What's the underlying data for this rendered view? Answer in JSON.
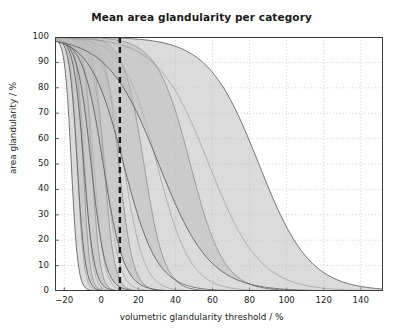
{
  "chart_data": {
    "type": "area",
    "title": "Mean area glandularity per category",
    "xlabel": "volumetric glandularity threshold / %",
    "ylabel": "area glandularity / %",
    "xlim": [
      -25,
      152
    ],
    "ylim": [
      0,
      100
    ],
    "xticks": [
      -20,
      0,
      20,
      40,
      60,
      80,
      100,
      120,
      140
    ],
    "xticklabels": [
      "−20",
      "0",
      "20",
      "40",
      "60",
      "80",
      "100",
      "120",
      "140"
    ],
    "yticks": [
      0,
      10,
      20,
      30,
      40,
      50,
      60,
      70,
      80,
      90,
      100
    ],
    "yticklabels": [
      "0",
      "10",
      "20",
      "30",
      "40",
      "50",
      "60",
      "70",
      "80",
      "90",
      "100"
    ],
    "grid": true,
    "grid_style": "dotted",
    "legend": "none",
    "fill_color": "#bdbdbd",
    "fill_opacity": 0.55,
    "line_color": "#555555",
    "annotations": [
      {
        "name": "threshold-line",
        "type": "vertical-dashed-line",
        "x": 10,
        "color": "#1a1a1a",
        "label": ""
      }
    ],
    "series": [
      {
        "name": "category-1",
        "midpoint": -13.0,
        "width": 7.0,
        "band_offset": 3.2,
        "x": [
          -25,
          -22,
          -19,
          -16,
          -13,
          -10,
          -7,
          -4,
          -1,
          2,
          6,
          10,
          20,
          40,
          80,
          120,
          152
        ],
        "upper": [
          100,
          100,
          99,
          96,
          86,
          65,
          38,
          18,
          8,
          4,
          2,
          1,
          0.3,
          0.1,
          0,
          0,
          0
        ],
        "lower": [
          100,
          99,
          97,
          90,
          72,
          44,
          20,
          8,
          3,
          1,
          0.5,
          0.2,
          0.1,
          0,
          0,
          0,
          0
        ],
        "mean": [
          100,
          100,
          98,
          93,
          79,
          55,
          29,
          13,
          5,
          2,
          1,
          0.5,
          0.2,
          0.05,
          0,
          0,
          0
        ]
      },
      {
        "name": "category-2",
        "midpoint": -9.0,
        "width": 8.5,
        "band_offset": 4.0,
        "x": [
          -25,
          -22,
          -19,
          -16,
          -13,
          -10,
          -6,
          -2,
          2,
          6,
          10,
          20,
          40,
          80,
          120,
          152
        ],
        "upper": [
          100,
          100,
          100,
          98,
          93,
          80,
          52,
          25,
          10,
          4,
          2,
          0.5,
          0.1,
          0,
          0,
          0
        ],
        "lower": [
          100,
          100,
          99,
          95,
          84,
          63,
          32,
          12,
          4,
          1.5,
          0.6,
          0.2,
          0,
          0,
          0,
          0
        ],
        "mean": [
          100,
          100,
          99,
          97,
          89,
          72,
          42,
          18,
          7,
          2.7,
          1.2,
          0.3,
          0.05,
          0,
          0,
          0
        ]
      },
      {
        "name": "category-3",
        "midpoint": -4.0,
        "width": 11.0,
        "band_offset": 5.5,
        "x": [
          -25,
          -20,
          -15,
          -10,
          -5,
          0,
          5,
          10,
          15,
          20,
          30,
          50,
          80,
          120,
          152
        ],
        "upper": [
          100,
          100,
          98,
          92,
          76,
          52,
          29,
          14,
          6,
          3,
          1,
          0.2,
          0,
          0,
          0
        ],
        "lower": [
          100,
          99,
          95,
          84,
          62,
          36,
          17,
          7,
          3,
          1.2,
          0.4,
          0.05,
          0,
          0,
          0
        ],
        "mean": [
          100,
          100,
          97,
          88,
          69,
          44,
          23,
          10,
          4.5,
          2,
          0.7,
          0.1,
          0,
          0,
          0
        ]
      },
      {
        "name": "category-4",
        "midpoint": 2.0,
        "width": 15.0,
        "band_offset": 7.5,
        "x": [
          -25,
          -20,
          -15,
          -10,
          -5,
          0,
          5,
          10,
          20,
          30,
          40,
          60,
          90,
          120,
          152
        ],
        "upper": [
          100,
          100,
          99,
          95,
          86,
          70,
          50,
          32,
          12,
          5,
          2,
          0.4,
          0.05,
          0,
          0
        ],
        "lower": [
          100,
          99,
          96,
          88,
          72,
          51,
          30,
          16,
          5,
          1.7,
          0.6,
          0.1,
          0,
          0,
          0
        ],
        "mean": [
          100,
          100,
          98,
          92,
          80,
          61,
          40,
          23,
          8,
          3,
          1.2,
          0.2,
          0.02,
          0,
          0
        ]
      },
      {
        "name": "category-5",
        "midpoint": 12.0,
        "width": 22.0,
        "band_offset": 11.0,
        "x": [
          -25,
          -20,
          -10,
          0,
          10,
          20,
          30,
          40,
          60,
          80,
          110,
          140,
          152
        ],
        "upper": [
          100,
          100,
          97,
          88,
          70,
          48,
          29,
          16,
          5,
          1.6,
          0.3,
          0.05,
          0
        ],
        "lower": [
          100,
          99,
          93,
          78,
          54,
          30,
          15,
          7,
          1.8,
          0.5,
          0.08,
          0,
          0
        ],
        "mean": [
          100,
          100,
          95,
          83,
          62,
          39,
          21,
          11,
          3,
          1,
          0.15,
          0.02,
          0
        ]
      },
      {
        "name": "category-6",
        "midpoint": 30.0,
        "width": 36.0,
        "band_offset": 18.0,
        "x": [
          -25,
          -10,
          0,
          10,
          20,
          30,
          40,
          60,
          80,
          100,
          120,
          140,
          152
        ],
        "upper": [
          100,
          99,
          96,
          90,
          80,
          66,
          50,
          25,
          10,
          4,
          1.4,
          0.5,
          0.3
        ],
        "lower": [
          100,
          96,
          90,
          79,
          63,
          45,
          28,
          10,
          3,
          1,
          0.3,
          0.1,
          0.05
        ],
        "mean": [
          100,
          98,
          93,
          85,
          72,
          56,
          39,
          17,
          6,
          2.3,
          0.8,
          0.3,
          0.15
        ]
      },
      {
        "name": "category-7",
        "midpoint": 58.0,
        "width": 55.0,
        "band_offset": 27.0,
        "x": [
          -25,
          0,
          10,
          20,
          30,
          40,
          60,
          70,
          80,
          100,
          120,
          140,
          152
        ],
        "upper": [
          100,
          99,
          98,
          96,
          93,
          89,
          75,
          66,
          56,
          34,
          17,
          7,
          4
        ],
        "lower": [
          100,
          95,
          92,
          88,
          82,
          74,
          53,
          42,
          32,
          15,
          6,
          2,
          1
        ],
        "mean": [
          100,
          97,
          95,
          92,
          88,
          82,
          64,
          54,
          44,
          24,
          11,
          4,
          2.5
        ]
      }
    ]
  },
  "axes": {
    "title": "Mean area glandularity per category",
    "x_axis_label": "volumetric glandularity threshold / %",
    "y_axis_label": "area glandularity / %",
    "x_tick_labels": [
      "−20",
      "0",
      "20",
      "40",
      "60",
      "80",
      "100",
      "120",
      "140"
    ],
    "y_tick_labels": [
      "100",
      "90",
      "80",
      "70",
      "60",
      "50",
      "40",
      "30",
      "20",
      "10",
      "0"
    ]
  }
}
